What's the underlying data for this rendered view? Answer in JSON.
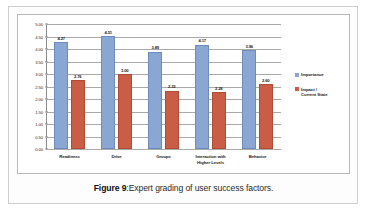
{
  "figure": {
    "caption_lead": "Figure 9",
    "caption_separator": ":",
    "caption_text": "Expert grading of user success factors."
  },
  "legend": {
    "position": "right",
    "items": [
      {
        "label": "Importance",
        "color": "#8aa6d2"
      },
      {
        "label": "Impact / Current State",
        "color": "#ca5d46"
      }
    ]
  },
  "axis": {
    "y_ticks": [
      "5.00",
      "4.50",
      "4.00",
      "3.50",
      "3.00",
      "2.50",
      "2.00",
      "1.50",
      "1.00",
      "0.50",
      "0.00"
    ]
  },
  "chart_data": {
    "type": "bar",
    "title": "",
    "subtitle": "",
    "xlabel": "",
    "ylabel": "",
    "ylim": [
      0,
      5
    ],
    "ytick_step": 0.5,
    "grid": true,
    "legend_position": "right",
    "categories": [
      "Readiness",
      "Drive",
      "Groups",
      "Interaction with Higher Levels",
      "Behavior"
    ],
    "category_lines": [
      [
        "Readiness"
      ],
      [
        "Drive"
      ],
      [
        "Groups"
      ],
      [
        "Interaction with",
        "Higher Levels"
      ],
      [
        "Behavior"
      ]
    ],
    "series": [
      {
        "name": "Importance",
        "color": "#8aa6d2",
        "values": [
          4.27,
          4.51,
          3.89,
          4.17,
          3.96
        ],
        "labels": [
          "4.27",
          "4.51",
          "3.89",
          "4.17",
          "3.96"
        ]
      },
      {
        "name": "Impact / Current State",
        "color": "#ca5d46",
        "values": [
          2.76,
          3.0,
          2.33,
          2.28,
          2.6
        ],
        "labels": [
          "2.76",
          "3.00",
          "2.33",
          "2.28",
          "2.60"
        ]
      }
    ]
  }
}
